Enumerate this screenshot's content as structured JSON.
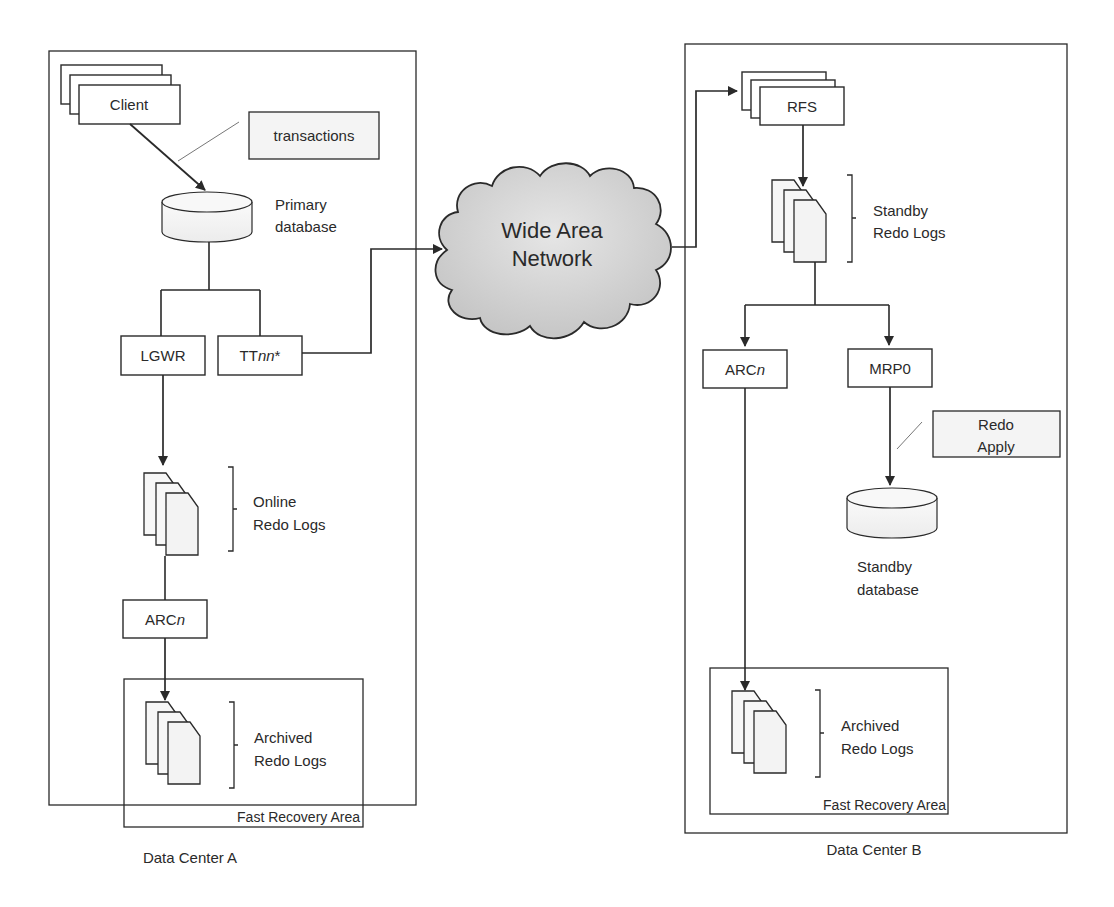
{
  "diagram": {
    "colors": {
      "stroke": "#2a2a2a",
      "box_fill": "#ffffff",
      "db_fill": "#f2f2f2",
      "cloud_fill": "#d4d4d4",
      "doc_fill": "#f5f5f5",
      "callout_fill": "#f4f4f4"
    },
    "data_center_a": {
      "label": "Data Center A",
      "client": "Client",
      "transactions_callout": "transactions",
      "primary_db": {
        "line1": "Primary",
        "line2": "database"
      },
      "lgwr": "LGWR",
      "ttnn": {
        "prefix": "TT",
        "italic": "nn",
        "suffix": "*"
      },
      "online_logs": {
        "line1": "Online",
        "line2": "Redo Logs"
      },
      "arcn": {
        "prefix": "ARC",
        "italic": "n"
      },
      "archived_logs": {
        "line1": "Archived",
        "line2": "Redo Logs"
      },
      "fra": "Fast Recovery Area"
    },
    "network": {
      "line1": "Wide Area",
      "line2": "Network"
    },
    "data_center_b": {
      "label": "Data Center B",
      "rfs": "RFS",
      "standby_logs": {
        "line1": "Standby",
        "line2": "Redo Logs"
      },
      "arcn": {
        "prefix": "ARC",
        "italic": "n"
      },
      "mrp0": "MRP0",
      "redo_apply_callout": {
        "line1": "Redo",
        "line2": "Apply"
      },
      "standby_db": {
        "line1": "Standby",
        "line2": "database"
      },
      "archived_logs": {
        "line1": "Archived",
        "line2": "Redo Logs"
      },
      "fra": "Fast Recovery Area"
    }
  }
}
